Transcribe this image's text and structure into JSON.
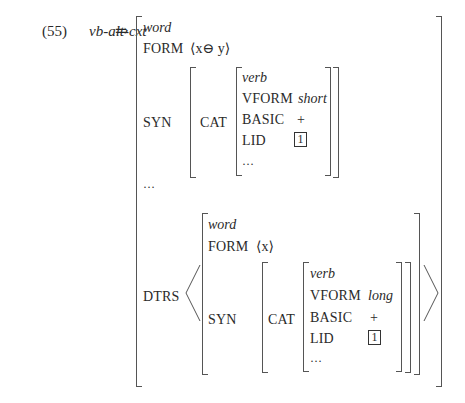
{
  "example": {
    "number": "(55)",
    "name": "vb-alt-cxt",
    "arrow": "⇒"
  },
  "avm": {
    "type": "word",
    "form": {
      "label": "FORM",
      "value": "⟨x⊖ y⟩"
    },
    "syn": {
      "label": "SYN",
      "cat": {
        "label": "CAT",
        "type": "verb",
        "vform": {
          "label": "VFORM",
          "value": "short"
        },
        "basic": {
          "label": "BASIC",
          "value": "+"
        },
        "lid": {
          "label": "LID",
          "tag": "1"
        },
        "ellipsis": "…"
      }
    },
    "ellipsis": "…",
    "dtrs": {
      "label": "DTRS",
      "word": {
        "type": "word",
        "form": {
          "label": "FORM",
          "value": "⟨x⟩"
        },
        "syn": {
          "label": "SYN",
          "cat": {
            "label": "CAT",
            "type": "verb",
            "vform": {
              "label": "VFORM",
              "value": "long"
            },
            "basic": {
              "label": "BASIC",
              "value": "+"
            },
            "lid": {
              "label": "LID",
              "tag": "1"
            },
            "ellipsis": "…"
          }
        }
      }
    }
  }
}
